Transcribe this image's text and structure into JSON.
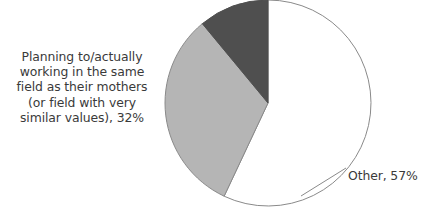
{
  "chart_data": {
    "type": "pie",
    "title": "",
    "subtitle": "",
    "xlabel": "",
    "ylabel": "",
    "legend_position": "none",
    "grid": false,
    "start_angle_deg": 0,
    "direction": "clockwise",
    "center": {
      "x": 268,
      "y": 103
    },
    "radius": 103,
    "labels": [
      "Other",
      "Planning to/actually working in the same field as their mothers (or field with very similar values)",
      "Other slice remainder"
    ],
    "categories": [
      "Other",
      "Planning to/actually working in the same field as their mothers (or field with very similar values)",
      ""
    ],
    "values": [
      57,
      32,
      11
    ],
    "slices": [
      {
        "name": "other",
        "label_text": "Other, 57%",
        "value": 57,
        "color": "#ffffff",
        "stroke": "#8a8a8a",
        "start_deg": 0,
        "end_deg": 205.2
      },
      {
        "name": "same-field-as-mothers",
        "label_text": "Planning to/actually\nworking in the same\nfield as their mothers\n(or field with very\nsimilar values), 32%",
        "value": 32,
        "color": "#b5b5b5",
        "stroke": "#8a8a8a",
        "start_deg": 205.2,
        "end_deg": 320.4
      },
      {
        "name": "remainder-dark",
        "label_text": "",
        "value": 11,
        "color": "#4f4f4f",
        "stroke": "#4f4f4f",
        "start_deg": 320.4,
        "end_deg": 360
      }
    ],
    "annotations": [
      {
        "name": "other-leader-line",
        "from": {
          "x": 301,
          "y": 196
        },
        "to": {
          "x": 346,
          "y": 168
        }
      }
    ]
  },
  "labels": {
    "left_callout": "Planning to/actually\nworking in the same\nfield as their mothers\n(or field with very\nsimilar values), 32%",
    "right_callout": "Other, 57%"
  },
  "colors": {
    "slice_other": "#ffffff",
    "slice_same_field": "#b5b5b5",
    "slice_remainder": "#4f4f4f",
    "outline": "#8a8a8a",
    "text": "#3a3a3a",
    "background": "#ffffff"
  }
}
